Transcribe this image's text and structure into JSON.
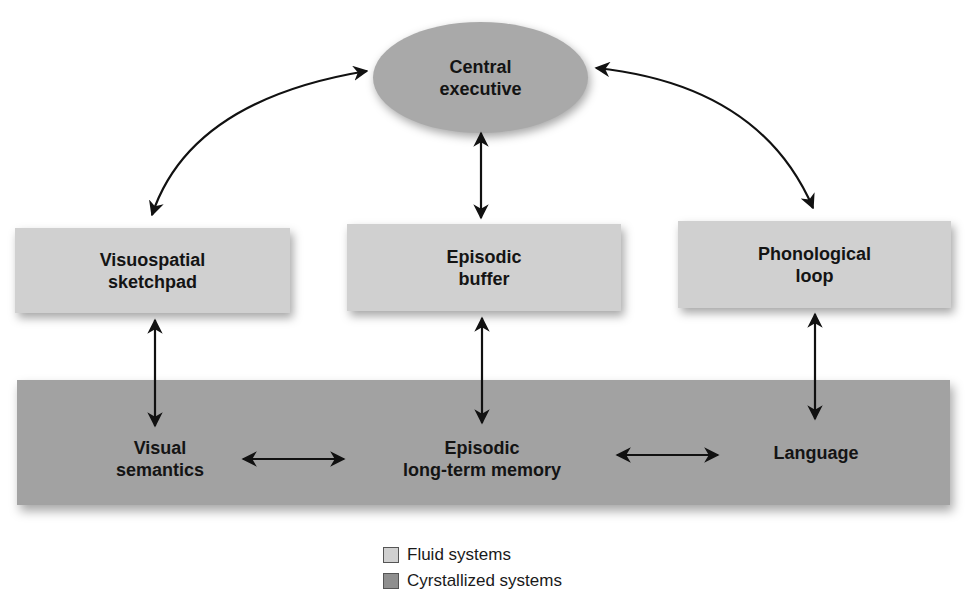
{
  "diagram": {
    "central": {
      "lines": [
        "Central",
        "executive"
      ]
    },
    "boxes": [
      {
        "id": "visuospatial",
        "lines": [
          "Visuospatial",
          "sketchpad"
        ]
      },
      {
        "id": "episodic-buffer",
        "lines": [
          "Episodic",
          "buffer"
        ]
      },
      {
        "id": "phonological",
        "lines": [
          "Phonological",
          "loop"
        ]
      }
    ],
    "band": [
      {
        "id": "visual-semantics",
        "lines": [
          "Visual",
          "semantics"
        ]
      },
      {
        "id": "episodic-ltm",
        "lines": [
          "Episodic",
          "long-term memory"
        ]
      },
      {
        "id": "language",
        "lines": [
          "Language"
        ]
      }
    ]
  },
  "legend": [
    {
      "label": "Fluid systems",
      "color": "#d0d0d0"
    },
    {
      "label": "Cyrstallized systems",
      "color": "#8f8f8f"
    }
  ],
  "colors": {
    "ellipse": "#a9a9a9",
    "fluid": "#d0d0d0",
    "crystallized": "#a2a2a2",
    "arrow": "#111111"
  }
}
